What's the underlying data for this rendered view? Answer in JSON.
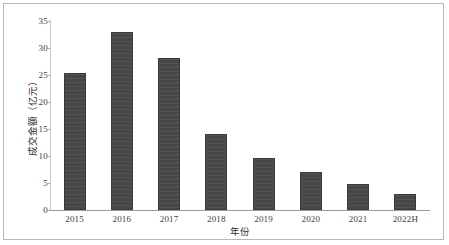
{
  "chart_data": {
    "type": "bar",
    "title": "",
    "xlabel": "年份",
    "ylabel": "成交金额（亿元）",
    "categories": [
      "2015",
      "2016",
      "2017",
      "2018",
      "2019",
      "2020",
      "2021",
      "2022H"
    ],
    "values": [
      25.4,
      33.0,
      28.1,
      14.1,
      9.6,
      7.0,
      4.9,
      2.9
    ],
    "ylim": [
      0,
      35
    ],
    "yticks": [
      0,
      5,
      10,
      15,
      20,
      25,
      30,
      35
    ],
    "ytick_labels": [
      "0",
      "5",
      "10",
      "15",
      "20",
      "25",
      "30",
      "35"
    ],
    "grid": false,
    "legend": false,
    "bar_color": "#474747",
    "bar_border_color": "#3a3a3a",
    "axis_color": "#9a9a9a",
    "frame_color": "#b9b9b9",
    "background": "#ffffff"
  }
}
